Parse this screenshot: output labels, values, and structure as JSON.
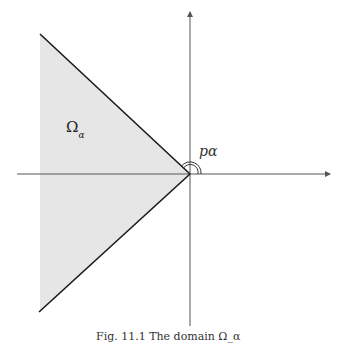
{
  "diagram": {
    "region_label": {
      "symbol": "Ω",
      "subscript": "α"
    },
    "angle_label": "pα",
    "caption": "Fig. 11.1  The domain Ω_α",
    "colors": {
      "region_fill": "#e6e6e6",
      "boundary": "#1a1a1a",
      "axis": "#555555"
    },
    "geometry": {
      "apex": [
        190,
        174
      ],
      "upper_boundary": [
        [
          40,
          34
        ],
        [
          190,
          174
        ]
      ],
      "lower_boundary": [
        [
          190,
          174
        ],
        [
          39,
          312
        ]
      ],
      "x_axis": [
        [
          17,
          174
        ],
        [
          330,
          174
        ]
      ],
      "y_axis": [
        [
          190,
          326
        ],
        [
          190,
          12
        ]
      ]
    }
  }
}
